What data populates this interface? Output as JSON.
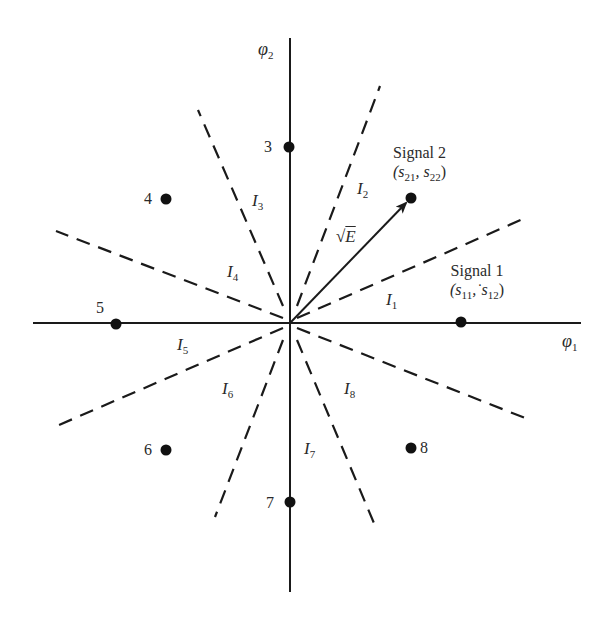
{
  "diagram": {
    "origin": {
      "x": 290,
      "y": 323
    },
    "axes": {
      "phi1": {
        "label": "φ",
        "sub": "1"
      },
      "phi2": {
        "label": "φ",
        "sub": "2"
      }
    },
    "energy_vector": {
      "label_radical": "√",
      "label_var": "E"
    },
    "signals": [
      {
        "id": "1",
        "name": "Signal 1",
        "coords_label": "(s",
        "c1": "11",
        "sep": ",˙s",
        "c2": "12",
        "close": ")"
      },
      {
        "id": "2",
        "name": "Signal 2",
        "coords_label": "(s",
        "c1": "21",
        "sep": ", s",
        "c2": "22",
        "close": ")"
      },
      {
        "id": "3",
        "label": "3"
      },
      {
        "id": "4",
        "label": "4"
      },
      {
        "id": "5",
        "label": "5"
      },
      {
        "id": "6",
        "label": "6"
      },
      {
        "id": "7",
        "label": "7"
      },
      {
        "id": "8",
        "label": "8"
      }
    ],
    "regions": [
      {
        "label": "I",
        "sub": "1"
      },
      {
        "label": "I",
        "sub": "2"
      },
      {
        "label": "I",
        "sub": "3"
      },
      {
        "label": "I",
        "sub": "4"
      },
      {
        "label": "I",
        "sub": "5"
      },
      {
        "label": "I",
        "sub": "6"
      },
      {
        "label": "I",
        "sub": "7"
      },
      {
        "label": "I",
        "sub": "8"
      }
    ],
    "colors": {
      "ink": "#1a1a1a",
      "background": "#ffffff"
    }
  }
}
